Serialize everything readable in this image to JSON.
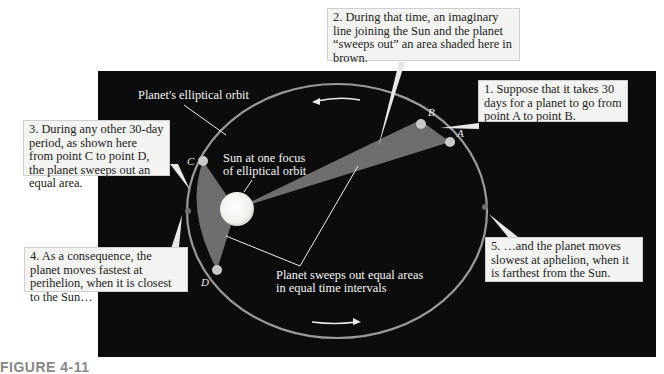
{
  "figure": {
    "caption": "FIGURE 4-11"
  },
  "labels": {
    "orbit": "Planet's elliptical orbit",
    "sun_line1": "Sun at one focus",
    "sun_line2": "of elliptical orbit",
    "sweeps_line1": "Planet sweeps out equal areas",
    "sweeps_line2": "in equal time intervals"
  },
  "points": {
    "A": "A",
    "B": "B",
    "C": "C",
    "D": "D"
  },
  "callouts": [
    {
      "id": 1,
      "text": "1. Suppose that it takes 30 days for a planet to go from point A to point B."
    },
    {
      "id": 2,
      "text": "2. During that time, an imaginary line joining the Sun and the planet “sweeps out” an area shaded here in brown."
    },
    {
      "id": 3,
      "text": "3. During any other 30-day period, as shown here from point C to point D, the planet sweeps out an equal area."
    },
    {
      "id": 4,
      "text": "4. As a consequence, the planet moves fastest at perihelion, when it is closest to the Sun…"
    },
    {
      "id": 5,
      "text": "5. …and the planet moves slowest at aphelion, when it is farthest from the Sun."
    }
  ],
  "colors": {
    "background": "#0c0c0c",
    "orbit": "#9a9a9a",
    "swept_area": "#6e6e6e",
    "sun": "#f5f5f5",
    "callout_bg": "#f3f3f1"
  }
}
